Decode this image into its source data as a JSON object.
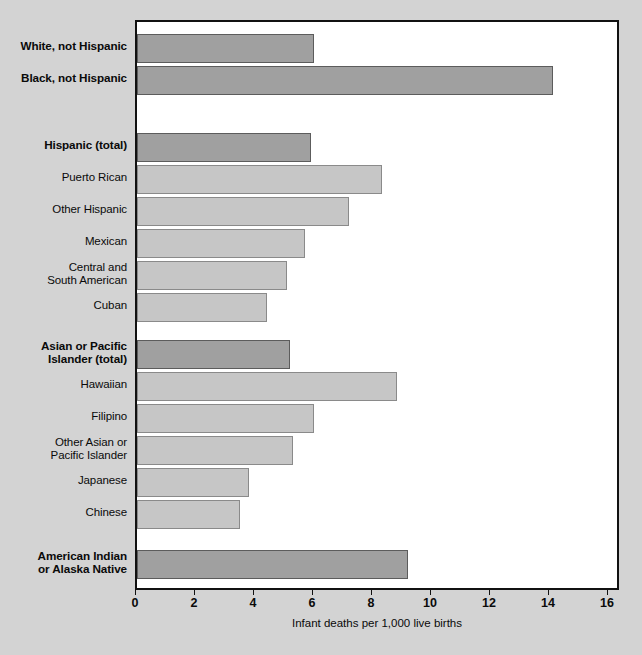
{
  "chart_data": {
    "type": "bar",
    "orientation": "horizontal",
    "title": "",
    "subtitle": "",
    "xlabel": "Infant deaths per 1,000 live births",
    "ylabel": "",
    "xlim": [
      0,
      16
    ],
    "xticks": [
      0,
      2,
      4,
      6,
      8,
      10,
      12,
      14,
      16
    ],
    "xtick_labels": [
      "0",
      "2",
      "4",
      "6",
      "8",
      "10",
      "12",
      "14",
      "16"
    ],
    "grid": false,
    "legend": "none",
    "colors": {
      "major_bar_fill": "#a0a0a0",
      "major_bar_edge": "#5c5c5c",
      "sub_bar_fill": "#c6c6c6",
      "sub_bar_edge": "#8a8a8a",
      "plot_background": "#ffffff",
      "figure_background": "#d3d3d3",
      "frame": "#111111",
      "text": "#0a0a0a"
    },
    "categories": [
      "White, not Hispanic",
      "Black, not Hispanic",
      "Hispanic (total)",
      "Puerto Rican",
      "Other Hispanic",
      "Mexican",
      "Central and\nSouth American",
      "Cuban",
      "Asian or Pacific\nIslander (total)",
      "Hawaiian",
      "Filipino",
      "Other Asian or\nPacific Islander",
      "Japanese",
      "Chinese",
      "American Indian\nor Alaska Native"
    ],
    "values": [
      6.0,
      14.1,
      5.9,
      8.3,
      7.2,
      5.7,
      5.1,
      4.4,
      5.2,
      8.8,
      6.0,
      5.3,
      3.8,
      3.5,
      9.2
    ],
    "bars": [
      {
        "label": "White, not Hispanic",
        "value": 6.0,
        "emphasis": "major",
        "group": "race"
      },
      {
        "label": "Black, not Hispanic",
        "value": 14.1,
        "emphasis": "major",
        "group": "race"
      },
      {
        "label": "Hispanic (total)",
        "value": 5.9,
        "emphasis": "major",
        "group": "hispanic"
      },
      {
        "label": "Puerto Rican",
        "value": 8.3,
        "emphasis": "sub",
        "group": "hispanic"
      },
      {
        "label": "Other Hispanic",
        "value": 7.2,
        "emphasis": "sub",
        "group": "hispanic"
      },
      {
        "label": "Mexican",
        "value": 5.7,
        "emphasis": "sub",
        "group": "hispanic"
      },
      {
        "label": "Central and\nSouth American",
        "value": 5.1,
        "emphasis": "sub",
        "group": "hispanic"
      },
      {
        "label": "Cuban",
        "value": 4.4,
        "emphasis": "sub",
        "group": "hispanic"
      },
      {
        "label": "Asian or Pacific\nIslander (total)",
        "value": 5.2,
        "emphasis": "major",
        "group": "asian"
      },
      {
        "label": "Hawaiian",
        "value": 8.8,
        "emphasis": "sub",
        "group": "asian"
      },
      {
        "label": "Filipino",
        "value": 6.0,
        "emphasis": "sub",
        "group": "asian"
      },
      {
        "label": "Other Asian or\nPacific Islander",
        "value": 5.3,
        "emphasis": "sub",
        "group": "asian"
      },
      {
        "label": "Japanese",
        "value": 3.8,
        "emphasis": "sub",
        "group": "asian"
      },
      {
        "label": "Chinese",
        "value": 3.5,
        "emphasis": "sub",
        "group": "asian"
      },
      {
        "label": "American Indian\nor Alaska Native",
        "value": 9.2,
        "emphasis": "major",
        "group": "aian"
      }
    ]
  },
  "layout": {
    "plot_left_px": 135,
    "plot_top_px": 20,
    "plot_width_px": 484,
    "plot_height_px": 570,
    "px_per_unit": 29.5,
    "bar_height_px": 29,
    "rows": [
      {
        "top": 12
      },
      {
        "top": 44
      },
      {
        "top": 111
      },
      {
        "top": 143
      },
      {
        "top": 175
      },
      {
        "top": 207
      },
      {
        "top": 239
      },
      {
        "top": 271
      },
      {
        "top": 318
      },
      {
        "top": 350
      },
      {
        "top": 382
      },
      {
        "top": 414
      },
      {
        "top": 446
      },
      {
        "top": 478
      },
      {
        "top": 528
      }
    ]
  }
}
